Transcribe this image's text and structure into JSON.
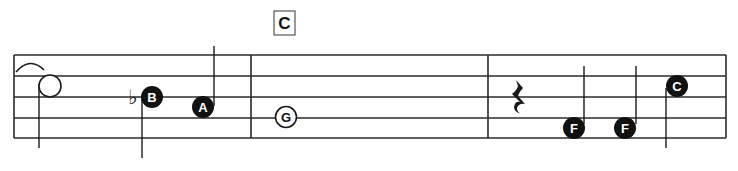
{
  "chord_symbol": {
    "label": "C"
  },
  "staff": {
    "lines": 5,
    "color": "#2a2a2a"
  },
  "measures": [
    {
      "index": 1,
      "notes": [
        {
          "type": "half-open",
          "label": "",
          "stem": "down"
        },
        {
          "type": "quarter",
          "accidental": "flat",
          "label": "B",
          "stem": "down"
        },
        {
          "type": "quarter",
          "label": "A",
          "stem": "up"
        }
      ]
    },
    {
      "index": 2,
      "notes": [
        {
          "type": "whole-open",
          "label": "G"
        }
      ]
    },
    {
      "index": 3,
      "notes": [
        {
          "type": "quarter-rest",
          "label": ""
        },
        {
          "type": "quarter",
          "label": "F",
          "stem": "up"
        },
        {
          "type": "quarter",
          "label": "F",
          "stem": "up"
        },
        {
          "type": "quarter",
          "label": "C",
          "stem": "down"
        }
      ]
    }
  ],
  "labels": {
    "b": "B",
    "a": "A",
    "g": "G",
    "f1": "F",
    "f2": "F",
    "c": "C",
    "flat": "♭"
  }
}
